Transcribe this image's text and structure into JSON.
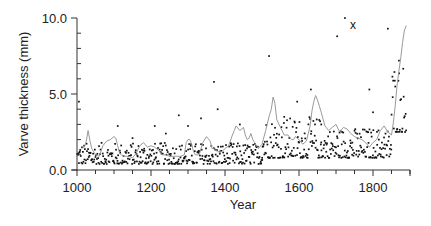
{
  "chart_data": {
    "type": "scatter",
    "title": "",
    "xlabel": "Year",
    "ylabel": "Varve thickness (mm)",
    "xlim": [
      1000,
      1900
    ],
    "ylim": [
      0,
      10
    ],
    "x_ticks": [
      1000,
      1200,
      1400,
      1600,
      1800
    ],
    "x_tick_labels": [
      "1000",
      "1200",
      "1400",
      "1600",
      "1800"
    ],
    "x_minor_tick_step": 50,
    "y_ticks": [
      0,
      5,
      10
    ],
    "y_tick_labels": [
      "0.0",
      "5.0",
      "10.0"
    ],
    "y_minor_tick_step": 1,
    "grid": false,
    "legend": null,
    "colors": {
      "points": "#111111",
      "line": "#9a9a9a",
      "axis": "#333333"
    },
    "annotations": [
      {
        "text": "x",
        "year": 1743,
        "value": 9.6
      }
    ],
    "series": [
      {
        "name": "smoothed varve thickness (gray line)",
        "type": "line",
        "x": [
          1015,
          1020,
          1025,
          1030,
          1035,
          1040,
          1045,
          1050,
          1060,
          1070,
          1080,
          1090,
          1100,
          1105,
          1110,
          1115,
          1120,
          1130,
          1140,
          1150,
          1160,
          1170,
          1180,
          1190,
          1200,
          1210,
          1220,
          1230,
          1240,
          1250,
          1260,
          1270,
          1280,
          1290,
          1295,
          1300,
          1305,
          1310,
          1315,
          1320,
          1330,
          1340,
          1350,
          1360,
          1365,
          1370,
          1375,
          1380,
          1390,
          1400,
          1410,
          1420,
          1425,
          1430,
          1440,
          1450,
          1455,
          1460,
          1465,
          1470,
          1475,
          1480,
          1490,
          1500,
          1510,
          1520,
          1525,
          1530,
          1535,
          1540,
          1550,
          1560,
          1570,
          1580,
          1585,
          1590,
          1600,
          1610,
          1620,
          1630,
          1635,
          1640,
          1645,
          1650,
          1655,
          1660,
          1670,
          1680,
          1690,
          1700,
          1710,
          1720,
          1730,
          1740,
          1750,
          1760,
          1770,
          1780,
          1790,
          1800,
          1810,
          1820,
          1830,
          1840,
          1850,
          1855,
          1860,
          1865,
          1870,
          1875,
          1880,
          1885,
          1890
        ],
        "values": [
          1.5,
          1.5,
          1.9,
          2.6,
          1.9,
          1.4,
          1.2,
          1.0,
          0.9,
          1.6,
          1.9,
          2.0,
          2.2,
          2.1,
          1.6,
          1.1,
          1.0,
          0.9,
          0.9,
          0.8,
          1.1,
          1.6,
          1.8,
          1.5,
          1.6,
          1.5,
          1.3,
          1.0,
          1.0,
          0.9,
          0.9,
          0.9,
          0.9,
          1.0,
          1.8,
          2.0,
          2.0,
          1.7,
          1.2,
          1.0,
          1.0,
          1.8,
          2.2,
          1.9,
          1.4,
          1.4,
          1.3,
          1.2,
          1.2,
          1.4,
          1.6,
          2.3,
          2.6,
          2.9,
          2.6,
          2.8,
          2.3,
          2.0,
          2.1,
          2.4,
          2.0,
          1.8,
          1.4,
          1.7,
          2.6,
          3.6,
          4.0,
          4.8,
          4.4,
          3.3,
          2.8,
          2.3,
          2.3,
          2.0,
          2.0,
          2.2,
          2.0,
          1.7,
          1.9,
          2.9,
          3.9,
          4.5,
          4.9,
          4.6,
          4.2,
          3.8,
          2.9,
          2.6,
          2.8,
          3.0,
          2.5,
          2.8,
          2.7,
          2.4,
          2.2,
          2.1,
          2.0,
          1.8,
          1.5,
          1.8,
          2.0,
          2.6,
          2.9,
          2.5,
          2.3,
          3.1,
          4.2,
          5.6,
          6.5,
          7.4,
          8.4,
          9.2,
          9.5
        ]
      },
      {
        "name": "annual varve thickness (black dots, upper outliers)",
        "type": "scatter",
        "points": [
          [
            1005,
            4.5
          ],
          [
            1110,
            2.9
          ],
          [
            1150,
            2.1
          ],
          [
            1210,
            2.9
          ],
          [
            1240,
            2.4
          ],
          [
            1275,
            3.6
          ],
          [
            1300,
            2.9
          ],
          [
            1335,
            3.4
          ],
          [
            1370,
            5.8
          ],
          [
            1380,
            4.0
          ],
          [
            1440,
            3.0
          ],
          [
            1519,
            7.5
          ],
          [
            1560,
            3.5
          ],
          [
            1595,
            4.5
          ],
          [
            1632,
            5.3
          ],
          [
            1660,
            3.0
          ],
          [
            1703,
            8.8
          ],
          [
            1724,
            10.0
          ],
          [
            1790,
            5.3
          ],
          [
            1800,
            3.8
          ],
          [
            1840,
            9.3
          ],
          [
            1870,
            7.2
          ]
        ]
      },
      {
        "name": "annual varve thickness (black dots, main cloud)",
        "type": "scatter",
        "description": "dense scatter of yearly values mostly between 0.4 and 2.0 mm from 1000–1500, rising to 1.0–3.5 mm 1500–1850, and 2.5–7 mm after 1850",
        "band": [
          {
            "x_range": [
              1000,
              1500
            ],
            "value_range": [
              0.4,
              1.8
            ]
          },
          {
            "x_range": [
              1500,
              1660
            ],
            "value_range": [
              0.8,
              3.5
            ]
          },
          {
            "x_range": [
              1660,
              1850
            ],
            "value_range": [
              0.8,
              2.8
            ]
          },
          {
            "x_range": [
              1850,
              1890
            ],
            "value_range": [
              2.5,
              7.2
            ]
          }
        ]
      }
    ]
  }
}
